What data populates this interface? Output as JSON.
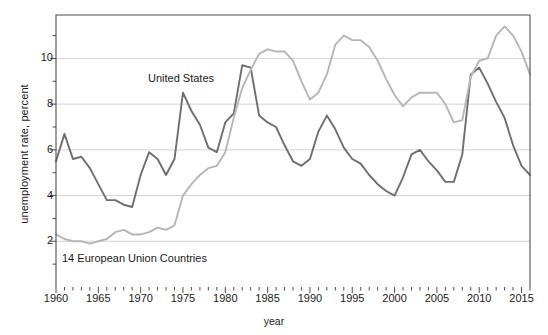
{
  "chart_data": {
    "type": "line",
    "title": "",
    "xlabel": "year",
    "ylabel": "unemployment rate, percent",
    "xlim": [
      1960,
      2016
    ],
    "ylim": [
      0,
      11.9
    ],
    "grid": "horizontal",
    "legend_position": "inline-annotations",
    "yticks": [
      2,
      4,
      6,
      8,
      10
    ],
    "ytick_labels": [
      "2",
      "4",
      "6",
      "8",
      "10"
    ],
    "y_minor_ticks": [
      1,
      3,
      5,
      7,
      9,
      11
    ],
    "xticks": [
      1960,
      1965,
      1970,
      1975,
      1980,
      1985,
      1990,
      1995,
      2000,
      2005,
      2010,
      2015
    ],
    "xtick_labels": [
      "1960",
      "1965",
      "1970",
      "1975",
      "1980",
      "1985",
      "1990",
      "1995",
      "2000",
      "2005",
      "2010",
      "2015"
    ],
    "x": [
      1960,
      1961,
      1962,
      1963,
      1964,
      1965,
      1966,
      1967,
      1968,
      1969,
      1970,
      1971,
      1972,
      1973,
      1974,
      1975,
      1976,
      1977,
      1978,
      1979,
      1980,
      1981,
      1982,
      1983,
      1984,
      1985,
      1986,
      1987,
      1988,
      1989,
      1990,
      1991,
      1992,
      1993,
      1994,
      1995,
      1996,
      1997,
      1998,
      1999,
      2000,
      2001,
      2002,
      2003,
      2004,
      2005,
      2006,
      2007,
      2008,
      2009,
      2010,
      2011,
      2012,
      2013,
      2014,
      2015,
      2016
    ],
    "series": [
      {
        "name": "United States",
        "color": "#6e6e6e",
        "values": [
          5.5,
          6.7,
          5.6,
          5.7,
          5.2,
          4.5,
          3.8,
          3.8,
          3.6,
          3.5,
          4.9,
          5.9,
          5.6,
          4.9,
          5.6,
          8.5,
          7.7,
          7.1,
          6.1,
          5.9,
          7.2,
          7.6,
          9.7,
          9.6,
          7.5,
          7.2,
          7.0,
          6.2,
          5.5,
          5.3,
          5.6,
          6.8,
          7.5,
          6.9,
          6.1,
          5.6,
          5.4,
          4.9,
          4.5,
          4.2,
          4.0,
          4.8,
          5.8,
          6.0,
          5.5,
          5.1,
          4.6,
          4.6,
          5.8,
          9.3,
          9.6,
          8.9,
          8.1,
          7.4,
          6.2,
          5.3,
          4.9
        ]
      },
      {
        "name": "14 European Union Countries",
        "color": "#b6b6b6",
        "values": [
          2.3,
          2.1,
          2.0,
          2.0,
          1.9,
          2.0,
          2.1,
          2.4,
          2.5,
          2.3,
          2.3,
          2.4,
          2.6,
          2.5,
          2.7,
          4.0,
          4.5,
          4.9,
          5.2,
          5.3,
          5.9,
          7.4,
          8.7,
          9.5,
          10.2,
          10.4,
          10.3,
          10.3,
          9.9,
          9.0,
          8.2,
          8.5,
          9.3,
          10.6,
          11.0,
          10.8,
          10.8,
          10.5,
          9.9,
          9.1,
          8.4,
          7.9,
          8.3,
          8.5,
          8.5,
          8.5,
          8.0,
          7.2,
          7.3,
          9.2,
          9.9,
          10.0,
          11.0,
          11.4,
          11.0,
          10.3,
          9.3
        ]
      }
    ],
    "annotations": [
      {
        "text": "United States",
        "x_px": 148,
        "y_px": 72
      },
      {
        "text": "14 European Union Countries",
        "x_px": 62,
        "y_px": 252
      }
    ]
  },
  "axes": {
    "x_axis_label": "year",
    "y_axis_label": "unemployment rate, percent"
  }
}
